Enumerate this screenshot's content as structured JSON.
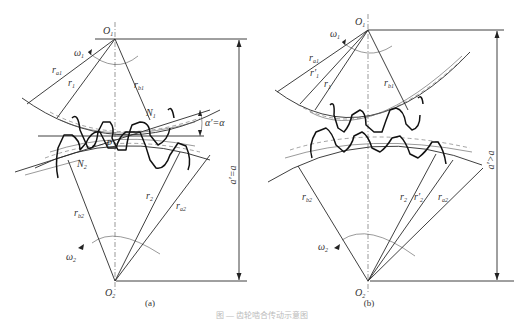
{
  "figure": {
    "caption": "图 — 齿轮啮合传动示意图",
    "panels": [
      {
        "id": "a",
        "label": "(a)",
        "center_top": "O",
        "center_top_sub": "1",
        "center_bottom": "O",
        "center_bottom_sub": "2",
        "omega1": "ω",
        "omega1_sub": "1",
        "omega2": "ω",
        "omega2_sub": "2",
        "ra1": "r",
        "ra1_sub": "a1",
        "r1": "r",
        "r1_sub": "1",
        "rb1": "r",
        "rb1_sub": "b1",
        "rb2": "r",
        "rb2_sub": "b2",
        "r2": "r",
        "r2_sub": "2",
        "ra2": "r",
        "ra2_sub": "a2",
        "N1": "N",
        "N1_sub": "1",
        "N2": "N",
        "N2_sub": "2",
        "P": "P",
        "angle": "α′=α",
        "distance": "a′=a"
      },
      {
        "id": "b",
        "label": "(b)",
        "center_top": "O",
        "center_top_sub": "1",
        "center_bottom": "O",
        "center_bottom_sub": "2",
        "omega1": "ω",
        "omega1_sub": "1",
        "omega2": "ω",
        "omega2_sub": "2",
        "ra1": "r",
        "ra1_sub": "a1",
        "r1p": "r′",
        "r1p_sub": "1",
        "r1": "r",
        "r1_sub": "1",
        "rb1": "r",
        "rb1_sub": "b1",
        "rb2": "r",
        "rb2_sub": "b2",
        "r2": "r",
        "r2_sub": "2",
        "r2p": "r′",
        "r2p_sub": "2",
        "ra2": "r",
        "ra2_sub": "a2",
        "distance": "a′>a"
      }
    ]
  }
}
